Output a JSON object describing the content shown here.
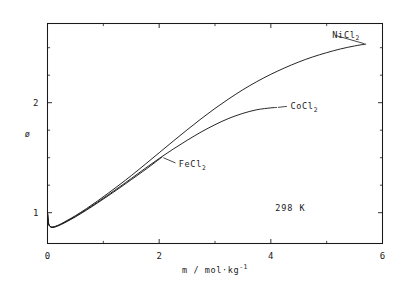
{
  "chart_data": {
    "type": "line",
    "title": "",
    "subtitle": "",
    "xlabel": "m / mol·kg⁻¹",
    "ylabel": "ø",
    "xlim": [
      0,
      6
    ],
    "ylim": [
      0.72,
      2.72
    ],
    "grid": false,
    "legend_position": "inline-curve-end-labels",
    "x_ticks_major": [
      0,
      2,
      4,
      6
    ],
    "x_ticks_major_labels": [
      "0",
      "2",
      "4",
      "6"
    ],
    "x_ticks_minor": [
      1,
      3,
      5
    ],
    "y_ticks_major": [
      1,
      2
    ],
    "y_ticks_major_labels": [
      "1",
      "2"
    ],
    "y_ticks_minor": [
      1.25,
      1.5,
      1.75,
      2.25,
      2.5
    ],
    "annotations": [
      {
        "id": "temperature",
        "text": "298 K",
        "x": 4.35,
        "y": 1.02
      }
    ],
    "series": [
      {
        "name": "FeCl₂",
        "label": "FeCl2",
        "label_html": "FeCl<sub>2</sub>",
        "color": "#1a1a1a",
        "label_x": 2.35,
        "label_y": 1.44,
        "x": [
          0.0,
          0.02,
          0.05,
          0.08,
          0.12,
          0.18,
          0.25,
          0.35,
          0.5,
          0.7,
          0.9,
          1.1,
          1.3,
          1.5,
          1.7,
          1.85,
          2.0,
          2.05
        ],
        "y": [
          1.0,
          0.9,
          0.872,
          0.866,
          0.868,
          0.878,
          0.894,
          0.92,
          0.962,
          1.024,
          1.09,
          1.158,
          1.228,
          1.3,
          1.372,
          1.428,
          1.486,
          1.505
        ]
      },
      {
        "name": "CoCl₂",
        "label": "CoCl2",
        "label_html": "CoCl<sub>2</sub>",
        "color": "#1a1a1a",
        "label_x": 4.35,
        "label_y": 1.97,
        "x": [
          0.0,
          0.02,
          0.05,
          0.08,
          0.12,
          0.18,
          0.25,
          0.35,
          0.5,
          0.7,
          0.9,
          1.1,
          1.3,
          1.5,
          1.75,
          2.0,
          2.25,
          2.5,
          2.75,
          3.0,
          3.25,
          3.5,
          3.75,
          4.0,
          4.1
        ],
        "y": [
          1.0,
          0.9,
          0.874,
          0.868,
          0.87,
          0.881,
          0.897,
          0.924,
          0.967,
          1.03,
          1.097,
          1.167,
          1.238,
          1.311,
          1.403,
          1.493,
          1.578,
          1.658,
          1.733,
          1.8,
          1.858,
          1.903,
          1.936,
          1.953,
          1.956
        ]
      },
      {
        "name": "NiCl₂",
        "label": "NiCl2",
        "label_html": "NiCl<sub>2</sub>",
        "color": "#1a1a1a",
        "label_x": 5.1,
        "label_y": 2.62,
        "x": [
          0.0,
          0.02,
          0.05,
          0.08,
          0.12,
          0.18,
          0.25,
          0.35,
          0.5,
          0.7,
          0.9,
          1.1,
          1.3,
          1.5,
          1.75,
          2.0,
          2.25,
          2.5,
          2.75,
          3.0,
          3.25,
          3.5,
          3.75,
          4.0,
          4.25,
          4.5,
          4.75,
          5.0,
          5.25,
          5.5,
          5.7
        ],
        "y": [
          1.0,
          0.9,
          0.876,
          0.87,
          0.873,
          0.884,
          0.901,
          0.929,
          0.973,
          1.038,
          1.108,
          1.182,
          1.258,
          1.337,
          1.44,
          1.545,
          1.65,
          1.753,
          1.853,
          1.948,
          2.036,
          2.118,
          2.192,
          2.258,
          2.317,
          2.37,
          2.416,
          2.455,
          2.489,
          2.516,
          2.533
        ]
      }
    ]
  }
}
